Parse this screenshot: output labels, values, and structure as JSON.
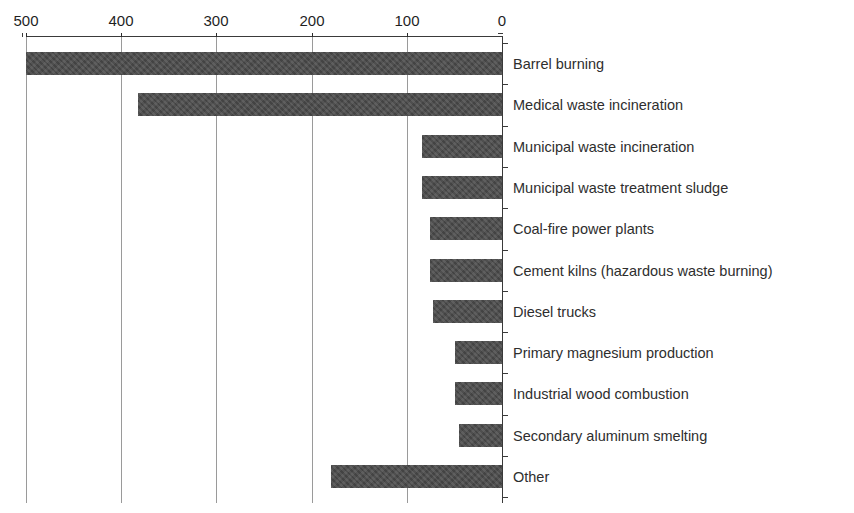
{
  "chart_data": {
    "type": "bar",
    "orientation": "horizontal",
    "title": "",
    "xlabel": "",
    "ylabel": "",
    "xlim": [
      500,
      0
    ],
    "axis_reversed": true,
    "grid": true,
    "legend": null,
    "xticks": [
      500,
      400,
      300,
      200,
      100,
      0
    ],
    "categories": [
      "Barrel burning",
      "Medical waste incineration",
      "Municipal waste incineration",
      "Municipal waste treatment sludge",
      "Coal-fire power plants",
      "Cement kilns (hazardous waste burning)",
      "Diesel trucks",
      "Primary magnesium production",
      "Industrial wood combustion",
      "Secondary aluminum smelting",
      "Other"
    ],
    "values": [
      500,
      382,
      84,
      84,
      76,
      76,
      72,
      49,
      49,
      45,
      180
    ],
    "bar_color": "#4a4a4a",
    "grid_color": "#9a9a9a",
    "axis_color": "#3a3a3a"
  },
  "axis": {
    "tick_labels": [
      "500",
      "400",
      "300",
      "200",
      "100",
      "0"
    ]
  }
}
